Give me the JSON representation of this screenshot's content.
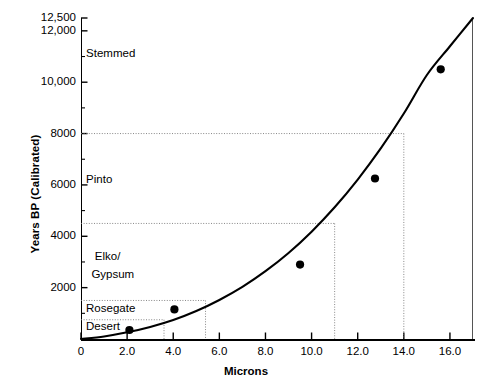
{
  "chart_data": {
    "type": "scatter",
    "title": "",
    "xlabel": "Microns",
    "ylabel": "Years BP (Calibrated)",
    "xlim": [
      0,
      17.0
    ],
    "ylim": [
      0,
      12500
    ],
    "grid": false,
    "legend": null,
    "x_ticks": [
      {
        "value": 0,
        "label": "0"
      },
      {
        "value": 2.0,
        "label": "2.0"
      },
      {
        "value": 4.0,
        "label": "4.0"
      },
      {
        "value": 6.0,
        "label": "6.0"
      },
      {
        "value": 8.0,
        "label": "8.0"
      },
      {
        "value": 10.0,
        "label": "10.0"
      },
      {
        "value": 12.0,
        "label": "12.0"
      },
      {
        "value": 14.0,
        "label": "14.0"
      },
      {
        "value": 16.0,
        "label": "16.0"
      }
    ],
    "y_ticks": [
      {
        "value": 12500,
        "label": "12,500",
        "major": true
      },
      {
        "value": 12000,
        "label": "12,000",
        "major": true
      },
      {
        "value": 11000,
        "label": "",
        "major": false
      },
      {
        "value": 10000,
        "label": "10,000",
        "major": true
      },
      {
        "value": 9000,
        "label": "",
        "major": false
      },
      {
        "value": 8000,
        "label": "8000",
        "major": true
      },
      {
        "value": 7000,
        "label": "",
        "major": false
      },
      {
        "value": 6000,
        "label": "6000",
        "major": true
      },
      {
        "value": 5000,
        "label": "",
        "major": false
      },
      {
        "value": 4000,
        "label": "4000",
        "major": true
      },
      {
        "value": 3000,
        "label": "",
        "major": false
      },
      {
        "value": 2000,
        "label": "2000",
        "major": true
      },
      {
        "value": 1000,
        "label": "",
        "major": false
      }
    ],
    "series": [
      {
        "name": "obsidian hydration measurements",
        "marker": "filled-circle",
        "color": "#000000",
        "points": [
          {
            "x": 2.1,
            "y": 350
          },
          {
            "x": 4.05,
            "y": 1150
          },
          {
            "x": 9.5,
            "y": 2900
          },
          {
            "x": 12.75,
            "y": 6250
          },
          {
            "x": 15.6,
            "y": 10500
          }
        ]
      }
    ],
    "fit_curve": {
      "name": "hydration rate curve",
      "color": "#000000",
      "points": [
        {
          "x": 0.0,
          "y": 0
        },
        {
          "x": 1.0,
          "y": 100
        },
        {
          "x": 2.0,
          "y": 260
        },
        {
          "x": 3.0,
          "y": 470
        },
        {
          "x": 4.0,
          "y": 740
        },
        {
          "x": 5.0,
          "y": 1090
        },
        {
          "x": 6.0,
          "y": 1520
        },
        {
          "x": 7.0,
          "y": 2030
        },
        {
          "x": 8.0,
          "y": 2640
        },
        {
          "x": 9.0,
          "y": 3350
        },
        {
          "x": 10.0,
          "y": 4180
        },
        {
          "x": 11.0,
          "y": 5130
        },
        {
          "x": 12.0,
          "y": 6210
        },
        {
          "x": 13.0,
          "y": 7420
        },
        {
          "x": 14.0,
          "y": 8780
        },
        {
          "x": 15.0,
          "y": 10280
        },
        {
          "x": 16.0,
          "y": 11400
        },
        {
          "x": 17.0,
          "y": 12500
        }
      ]
    },
    "reference_lines": [
      {
        "label": "Desert",
        "y": 750,
        "x_drop": 3.6
      },
      {
        "label": "Rosegate",
        "y": 1500,
        "x_drop": 5.4
      },
      {
        "label": "Elko/Gypsum",
        "y": 4500,
        "x_drop": 11.0
      },
      {
        "label": "Pinto",
        "y": 8000,
        "x_drop": 14.0
      }
    ],
    "category_labels": [
      {
        "text": "Stemmed",
        "x": 0.22,
        "y": 11100
      },
      {
        "text": "Pinto",
        "x": 0.22,
        "y": 6200
      },
      {
        "text": "Elko/",
        "x": 0.6,
        "y": 3200
      },
      {
        "text": "Gypsum",
        "x": 0.45,
        "y": 2500
      },
      {
        "text": "Rosegate",
        "x": 0.22,
        "y": 1150
      },
      {
        "text": "Desert",
        "x": 0.22,
        "y": 450
      }
    ]
  }
}
